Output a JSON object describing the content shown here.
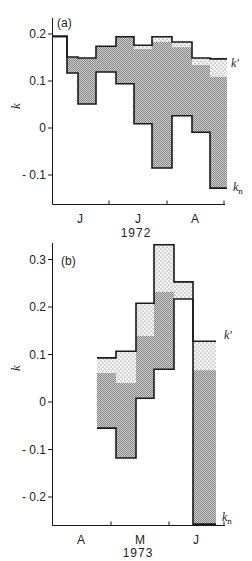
{
  "chart_data": [
    {
      "type": "bar",
      "subtype": "step-band",
      "panel_label": "(a)",
      "year": "1972",
      "ylabel": "k",
      "xlabel": "1972",
      "ylim": [
        -0.155,
        0.235
      ],
      "yticks": [
        {
          "value": 0.2,
          "label": "0.2"
        },
        {
          "value": 0.1,
          "label": "0.1"
        },
        {
          "value": 0,
          "label": "0"
        },
        {
          "value": -0.1,
          "label": "- 0.1"
        }
      ],
      "months": [
        "J",
        "J",
        "A"
      ],
      "month_names": [
        "June",
        "July",
        "August"
      ],
      "legend": [
        {
          "name": "k'",
          "description": "upper step line",
          "pattern": "dotted band above grey"
        },
        {
          "name": "k_n",
          "description": "lower step line",
          "pattern": "grey band above k_n"
        }
      ],
      "series_labels": {
        "upper": "k'",
        "lower": "k",
        "lower_sub": "n"
      },
      "segments": [
        {
          "k_prime": 0.195,
          "k_mid": 0.195,
          "k_n": 0.195
        },
        {
          "k_prime": 0.151,
          "k_mid": 0.151,
          "k_n": 0.117
        },
        {
          "k_prime": 0.149,
          "k_mid": 0.149,
          "k_n": 0.051
        },
        {
          "k_prime": 0.174,
          "k_mid": 0.174,
          "k_n": 0.119
        },
        {
          "k_prime": 0.194,
          "k_mid": 0.194,
          "k_n": 0.094
        },
        {
          "k_prime": 0.176,
          "k_mid": 0.168,
          "k_n": 0.009
        },
        {
          "k_prime": 0.194,
          "k_mid": 0.183,
          "k_n": -0.085
        },
        {
          "k_prime": 0.183,
          "k_mid": 0.172,
          "k_n": 0.026
        },
        {
          "k_prime": 0.149,
          "k_mid": 0.134,
          "k_n": -0.009
        },
        {
          "k_prime": 0.147,
          "k_mid": 0.109,
          "k_n": -0.128
        }
      ],
      "grid": false
    },
    {
      "type": "bar",
      "subtype": "step-band",
      "panel_label": "(b)",
      "year": "1973",
      "ylabel": "k",
      "xlabel": "1973",
      "ylim": [
        -0.26,
        0.335
      ],
      "yticks": [
        {
          "value": 0.3,
          "label": "0.3"
        },
        {
          "value": 0.2,
          "label": "0.2"
        },
        {
          "value": 0.1,
          "label": "0.1"
        },
        {
          "value": 0,
          "label": "0"
        },
        {
          "value": -0.1,
          "label": "- 0.1"
        },
        {
          "value": -0.2,
          "label": "- 0.2"
        }
      ],
      "months": [
        "A",
        "M",
        "J"
      ],
      "month_names": [
        "April",
        "May",
        "June"
      ],
      "legend": [
        {
          "name": "k'",
          "description": "upper step line",
          "pattern": "dotted band above grey"
        },
        {
          "name": "k_n",
          "description": "lower step line",
          "pattern": "grey band above k_n"
        }
      ],
      "series_labels": {
        "upper": "k'",
        "lower": "k",
        "lower_sub": "n"
      },
      "segments": [
        {
          "k_prime": 0.093,
          "k_mid": 0.061,
          "k_n": -0.055
        },
        {
          "k_prime": 0.107,
          "k_mid": 0.04,
          "k_n": -0.118
        },
        {
          "k_prime": 0.208,
          "k_mid": 0.139,
          "k_n": 0.008
        },
        {
          "k_prime": 0.331,
          "k_mid": 0.232,
          "k_n": 0.069
        },
        {
          "k_prime": 0.253,
          "k_mid": 0.217,
          "k_n": 0.217
        },
        {
          "k_prime": 0.128,
          "k_mid": 0.067,
          "k_n": -0.257
        }
      ],
      "grid": false
    }
  ],
  "colors": {
    "line": "#1a1a1a",
    "grey_fill": "#b8b8b8",
    "dot_fill": "#7a7a7a",
    "background": "#ffffff"
  }
}
